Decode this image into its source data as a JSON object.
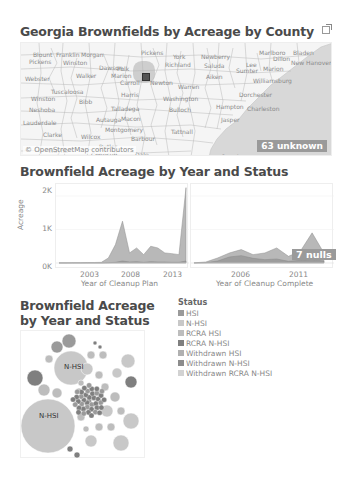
{
  "map": {
    "title": "Georgia Brownfields by Acreage by County",
    "attribution": "© OpenStreetMap contributors",
    "unknown_badge": "63 unknown",
    "county_labels": [
      {
        "text": "Blount",
        "x": 12,
        "y": 8
      },
      {
        "text": "Franklin",
        "x": 35,
        "y": 8
      },
      {
        "text": "Morgan",
        "x": 60,
        "y": 8
      },
      {
        "text": "Pickens",
        "x": 120,
        "y": 6
      },
      {
        "text": "York",
        "x": 152,
        "y": 10
      },
      {
        "text": "Newberry",
        "x": 180,
        "y": 10
      },
      {
        "text": "Marlboro",
        "x": 238,
        "y": 6
      },
      {
        "text": "Dillon",
        "x": 252,
        "y": 12
      },
      {
        "text": "Bladen",
        "x": 272,
        "y": 6
      },
      {
        "text": "Pickens",
        "x": 8,
        "y": 15
      },
      {
        "text": "Winston",
        "x": 42,
        "y": 16
      },
      {
        "text": "Dawson",
        "x": 78,
        "y": 21
      },
      {
        "text": "Polk",
        "x": 96,
        "y": 22
      },
      {
        "text": "Richland",
        "x": 144,
        "y": 18
      },
      {
        "text": "Saluda",
        "x": 183,
        "y": 19
      },
      {
        "text": "Lee",
        "x": 225,
        "y": 18
      },
      {
        "text": "Marion",
        "x": 242,
        "y": 22
      },
      {
        "text": "New Hanover",
        "x": 270,
        "y": 16
      },
      {
        "text": "Walker",
        "x": 55,
        "y": 29
      },
      {
        "text": "Marion",
        "x": 90,
        "y": 29
      },
      {
        "text": "Aiken",
        "x": 185,
        "y": 30
      },
      {
        "text": "Sumter",
        "x": 215,
        "y": 24
      },
      {
        "text": "Williamsburg",
        "x": 232,
        "y": 34
      },
      {
        "text": "Webster",
        "x": 4,
        "y": 32
      },
      {
        "text": "Carroll",
        "x": 99,
        "y": 36
      },
      {
        "text": "Newton",
        "x": 129,
        "y": 36
      },
      {
        "text": "Warren",
        "x": 157,
        "y": 40
      },
      {
        "text": "Tuscaloosa",
        "x": 30,
        "y": 45
      },
      {
        "text": "Harris",
        "x": 100,
        "y": 48
      },
      {
        "text": "Dorchester",
        "x": 218,
        "y": 48
      },
      {
        "text": "Winston",
        "x": 10,
        "y": 52
      },
      {
        "text": "Bibb",
        "x": 58,
        "y": 55
      },
      {
        "text": "Washington",
        "x": 142,
        "y": 52
      },
      {
        "text": "Neshoba",
        "x": 8,
        "y": 63
      },
      {
        "text": "Talladega",
        "x": 90,
        "y": 62
      },
      {
        "text": "Bulloch",
        "x": 148,
        "y": 63
      },
      {
        "text": "Hampton",
        "x": 195,
        "y": 60
      },
      {
        "text": "Charleston",
        "x": 226,
        "y": 62
      },
      {
        "text": "Autauga",
        "x": 75,
        "y": 73
      },
      {
        "text": "Macon",
        "x": 100,
        "y": 72
      },
      {
        "text": "Jasper",
        "x": 200,
        "y": 73
      },
      {
        "text": "Lauderdale",
        "x": 2,
        "y": 76
      },
      {
        "text": "Montgomery",
        "x": 84,
        "y": 83
      },
      {
        "text": "Clarke",
        "x": 22,
        "y": 88
      },
      {
        "text": "Wilcox",
        "x": 60,
        "y": 90
      },
      {
        "text": "Barbour",
        "x": 110,
        "y": 92
      },
      {
        "text": "Tattnall",
        "x": 150,
        "y": 85
      },
      {
        "text": "Butler",
        "x": 78,
        "y": 100
      },
      {
        "text": "Wayne",
        "x": 27,
        "y": 104
      },
      {
        "text": "Conecuh",
        "x": 70,
        "y": 108
      },
      {
        "text": "Dale",
        "x": 114,
        "y": 108
      },
      {
        "text": "Camden",
        "x": 200,
        "y": 110
      }
    ]
  },
  "area_chart": {
    "title": "Brownfield Acreage by Year and Status",
    "y_axis_label": "Acreage",
    "y_ticks": [
      "2K",
      "1K",
      "0K"
    ],
    "nulls_badge": "7 nulls"
  },
  "chart_data": [
    {
      "type": "area",
      "title": "Brownfield Acreage by Year and Status",
      "xlabel": "Year of Cleanup Plan",
      "ylabel": "Acreage",
      "x_ticks": [
        "2003",
        "2008",
        "2013"
      ],
      "y_ticks": [
        "0K",
        "1K",
        "2K"
      ],
      "ylim": [
        0,
        2300
      ],
      "x": [
        1996,
        1997,
        1998,
        1999,
        2000,
        2001,
        2002,
        2003,
        2004,
        2005,
        2006,
        2007,
        2008,
        2009,
        2010,
        2011,
        2012,
        2013,
        2014
      ],
      "series": [
        {
          "name": "N-HSI (stacked total)",
          "values": [
            5,
            5,
            10,
            10,
            15,
            15,
            20,
            150,
            550,
            1250,
            300,
            450,
            250,
            500,
            450,
            300,
            280,
            250,
            2250
          ]
        },
        {
          "name": "HSI",
          "values": [
            0,
            0,
            0,
            0,
            0,
            0,
            0,
            10,
            20,
            60,
            30,
            40,
            20,
            40,
            30,
            30,
            20,
            20,
            60
          ]
        }
      ]
    },
    {
      "type": "area",
      "xlabel": "Year of Cleanup Complete",
      "x_ticks": [
        "2006",
        "2011"
      ],
      "ylim": [
        0,
        2300
      ],
      "x": [
        2002,
        2003,
        2004,
        2005,
        2006,
        2007,
        2008,
        2009,
        2010,
        2011,
        2012,
        2013
      ],
      "series": [
        {
          "name": "N-HSI (stacked total)",
          "values": [
            5,
            30,
            150,
            300,
            400,
            250,
            300,
            450,
            200,
            350,
            900,
            300
          ]
        },
        {
          "name": "HSI",
          "values": [
            0,
            10,
            60,
            180,
            220,
            140,
            100,
            120,
            50,
            80,
            100,
            60
          ]
        }
      ]
    },
    {
      "type": "bubble",
      "title": "Brownfield Acreage by Year and Status",
      "labels_shown": [
        "N-HSI",
        "N-HSI"
      ],
      "legend_title": "Status"
    }
  ],
  "bubble_chart": {
    "title_line1": "Brownfield Acreage",
    "title_line2": "by Year and Status",
    "big_label_1": "N-HSI",
    "big_label_2": "N-HSI"
  },
  "legend": {
    "title": "Status",
    "items": [
      {
        "label": "HSI",
        "color": "#9a9a9a"
      },
      {
        "label": "N-HSI",
        "color": "#c8c8c8"
      },
      {
        "label": "RCRA HSI",
        "color": "#bdbdbd"
      },
      {
        "label": "RCRA N-HSI",
        "color": "#7f7f7f"
      },
      {
        "label": "Withdrawn HSI",
        "color": "#b0b0b0"
      },
      {
        "label": "Withdrawn N-HSI",
        "color": "#8c8c8c"
      },
      {
        "label": "Withdrawn RCRA N-HSI",
        "color": "#d2d2d2"
      }
    ]
  }
}
